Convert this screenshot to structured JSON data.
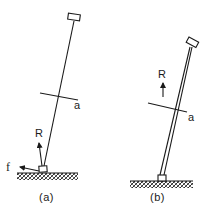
{
  "figure": {
    "panel_a": {
      "caption": "(a)",
      "force_R_label": "R",
      "force_f_label": "f",
      "section_label": "a"
    },
    "panel_b": {
      "caption": "(b)",
      "force_R_label": "R",
      "section_label": "a"
    }
  },
  "colors": {
    "ink": "#1a1a1a",
    "background": "#ffffff"
  }
}
